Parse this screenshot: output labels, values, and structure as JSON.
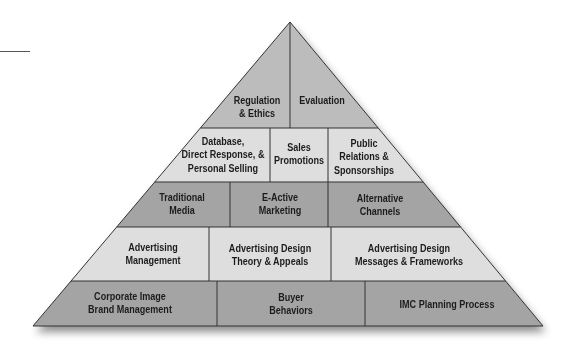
{
  "diagram": {
    "type": "pyramid",
    "colors": {
      "top": "#bcbcbc",
      "light": "#dedede",
      "dark": "#a4a4a4",
      "stroke": "#333333"
    },
    "levels": [
      {
        "level": 1,
        "position": "apex",
        "shade": "top",
        "blocks": [
          {
            "id": "regulation-ethics",
            "label": "Regulation\n& Ethics"
          },
          {
            "id": "evaluation",
            "label": "Evaluation"
          }
        ]
      },
      {
        "level": 2,
        "shade": "light",
        "blocks": [
          {
            "id": "database-direct-personal",
            "label": "Database,\nDirect Response, &\nPersonal Selling"
          },
          {
            "id": "sales-promotions",
            "label": "Sales\nPromotions"
          },
          {
            "id": "public-relations",
            "label": "Public\nRelations &\nSponsorships"
          }
        ]
      },
      {
        "level": 3,
        "shade": "dark",
        "blocks": [
          {
            "id": "traditional-media",
            "label": "Traditional\nMedia"
          },
          {
            "id": "e-active-marketing",
            "label": "E-Active\nMarketing"
          },
          {
            "id": "alternative-channels",
            "label": "Alternative\nChannels"
          }
        ]
      },
      {
        "level": 4,
        "shade": "light",
        "blocks": [
          {
            "id": "advertising-management",
            "label": "Advertising\nManagement"
          },
          {
            "id": "advertising-design-theory",
            "label": "Advertising Design\nTheory & Appeals"
          },
          {
            "id": "advertising-design-messages",
            "label": "Advertising Design\nMessages & Frameworks"
          }
        ]
      },
      {
        "level": 5,
        "position": "base",
        "shade": "dark",
        "blocks": [
          {
            "id": "corporate-image",
            "label": "Corporate Image\nBrand Management"
          },
          {
            "id": "buyer-behaviors",
            "label": "Buyer\nBehaviors"
          },
          {
            "id": "imc-planning",
            "label": "IMC Planning Process"
          }
        ]
      }
    ]
  }
}
